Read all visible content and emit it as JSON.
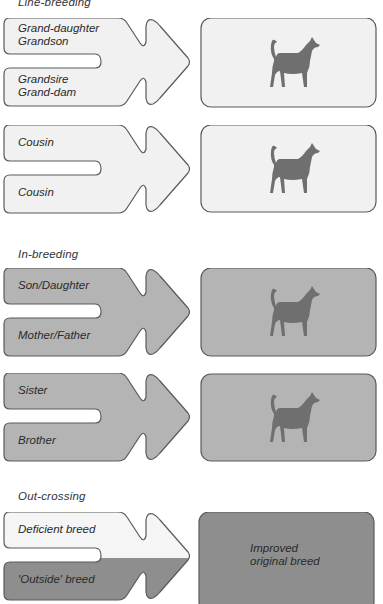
{
  "colors": {
    "stroke": "#5a5a5a",
    "light_fill": "#f1f1f1",
    "mid_fill": "#b4b4b4",
    "dark_fill": "#8e8e8e",
    "dog": "#6f6f6f"
  },
  "sections": [
    {
      "title": "Line-breeding",
      "rows": [
        {
          "top_label": [
            "Grand-daughter",
            "Grandson"
          ],
          "bottom_label": [
            "Grandsire",
            "Grand-dam"
          ],
          "result": "dog-silhouette"
        },
        {
          "top_label": [
            "Cousin"
          ],
          "bottom_label": [
            "Cousin"
          ],
          "result": "dog-silhouette"
        }
      ]
    },
    {
      "title": "In-breeding",
      "rows": [
        {
          "top_label": [
            "Son/Daughter"
          ],
          "bottom_label": [
            "Mother/Father"
          ],
          "result": "dog-silhouette"
        },
        {
          "top_label": [
            "Sister"
          ],
          "bottom_label": [
            "Brother"
          ],
          "result": "dog-silhouette"
        }
      ]
    },
    {
      "title": "Out-crossing",
      "rows": [
        {
          "top_label": [
            "Deficient breed"
          ],
          "bottom_label": [
            "'Outside' breed"
          ],
          "result_text": [
            "Improved",
            "original breed"
          ]
        }
      ]
    }
  ]
}
